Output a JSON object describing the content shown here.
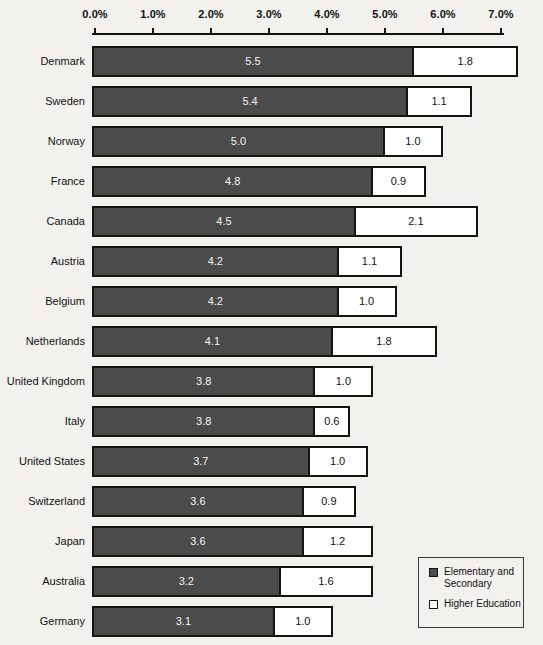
{
  "chart_data": {
    "type": "bar",
    "orientation": "horizontal",
    "stacked": true,
    "title": "",
    "subtitle": "",
    "xlabel": "",
    "ylabel": "",
    "xlim": [
      0.0,
      7.0
    ],
    "grid": false,
    "axis": {
      "tick_labels": [
        "0.0%",
        "1.0%",
        "2.0%",
        "3.0%",
        "4.0%",
        "5.0%",
        "6.0%",
        "7.0%"
      ],
      "tick_values": [
        0.0,
        1.0,
        2.0,
        3.0,
        4.0,
        5.0,
        6.0,
        7.0
      ],
      "position": "top"
    },
    "categories": [
      "Denmark",
      "Sweden",
      "Norway",
      "France",
      "Canada",
      "Austria",
      "Belgium",
      "Netherlands",
      "United Kingdom",
      "Italy",
      "United States",
      "Switzerland",
      "Japan",
      "Australia",
      "Germany"
    ],
    "series": [
      {
        "name": "Elementary and Secondary",
        "color": "#4b4b4b",
        "values": [
          5.5,
          5.4,
          5.0,
          4.8,
          4.5,
          4.2,
          4.2,
          4.1,
          3.8,
          3.8,
          3.7,
          3.6,
          3.6,
          3.2,
          3.1
        ],
        "labels": [
          "5.5",
          "5.4",
          "5.0",
          "4.8",
          "4.5",
          "4.2",
          "4.2",
          "4.1",
          "3.8",
          "3.8",
          "3.7",
          "3.6",
          "3.6",
          "3.2",
          "3.1"
        ]
      },
      {
        "name": "Higher Education",
        "color": "#ffffff",
        "values": [
          1.8,
          1.1,
          1.0,
          0.9,
          2.1,
          1.1,
          1.0,
          1.8,
          1.0,
          0.6,
          1.0,
          0.9,
          1.2,
          1.6,
          1.0
        ],
        "labels": [
          "1.8",
          "1.1",
          "1.0",
          "0.9",
          "2.1",
          "1.1",
          "1.0",
          "1.8",
          "1.0",
          "0.6",
          "1.0",
          "0.9",
          "1.2",
          "1.6",
          "1.0"
        ]
      }
    ],
    "legend": {
      "position": "bottom-right",
      "entries": [
        {
          "label": "Elementary and Secondary",
          "swatch": "filled"
        },
        {
          "label": "Higher Education",
          "swatch": "hollow"
        }
      ]
    }
  }
}
